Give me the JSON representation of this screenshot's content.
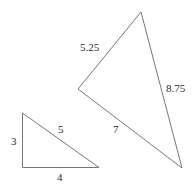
{
  "figure": {
    "name": "similar-triangles-diagram",
    "background_color": "#ffffff",
    "line_color": "#767676",
    "label_color": "#2b2b2b",
    "shapes": [
      {
        "name": "large-triangle",
        "vertices": [
          [
            141,
            12
          ],
          [
            78,
            89
          ],
          [
            182,
            168
          ]
        ],
        "labels": [
          {
            "name": "label-5-25",
            "text": "5.25",
            "x": 80,
            "y": 42
          },
          {
            "name": "label-8-75",
            "text": "8.75",
            "x": 166,
            "y": 83
          },
          {
            "name": "label-7",
            "text": "7",
            "x": 113,
            "y": 124
          }
        ]
      },
      {
        "name": "small-triangle",
        "vertices": [
          [
            22,
            113
          ],
          [
            22,
            167
          ],
          [
            99,
            167
          ]
        ],
        "labels": [
          {
            "name": "label-3",
            "text": "3",
            "x": 11,
            "y": 136
          },
          {
            "name": "label-5",
            "text": "5",
            "x": 58,
            "y": 124
          },
          {
            "name": "label-4",
            "text": "4",
            "x": 57,
            "y": 172
          }
        ]
      }
    ]
  },
  "labels": {
    "large_side_left": "5.25",
    "large_side_right": "8.75",
    "large_side_bottom": "7",
    "small_side_left": "3",
    "small_side_hypotenuse": "5",
    "small_side_bottom": "4"
  }
}
